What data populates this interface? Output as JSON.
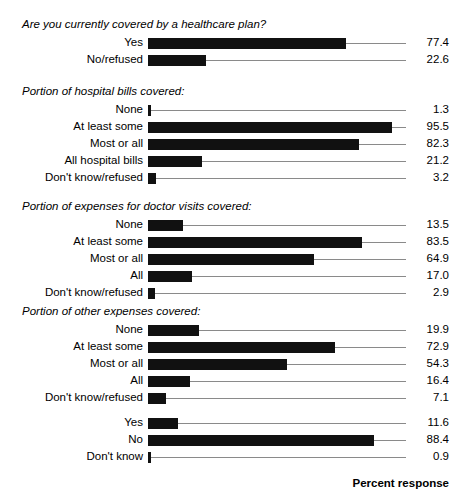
{
  "chart_data": {
    "type": "bar",
    "orientation": "horizontal",
    "title": "",
    "xlabel": "Percent response",
    "ylabel": "",
    "xlim": [
      0,
      100
    ],
    "grid": false,
    "legend": null,
    "value_labels": true,
    "bar_color": "#111111",
    "leader_color": "#8a8a8a",
    "groups": [
      {
        "title": "Are you currently covered by a healthcare plan?",
        "categories": [
          "Yes",
          "No/refused"
        ],
        "values": [
          77.4,
          22.6
        ],
        "value_labels": [
          "77.4",
          "22.6"
        ]
      },
      {
        "title": "Portion of hospital bills covered:",
        "categories": [
          "None",
          "At least some",
          "Most or all",
          "All hospital bills",
          "Don't know/refused"
        ],
        "values": [
          1.3,
          95.5,
          82.3,
          21.2,
          3.2
        ],
        "value_labels": [
          "1.3",
          "95.5",
          "82.3",
          "21.2",
          "3.2"
        ]
      },
      {
        "title": "Portion of expenses for doctor visits covered:",
        "categories": [
          "None",
          "At least some",
          "Most or all",
          "All",
          "Don't know/refused"
        ],
        "values": [
          13.5,
          83.5,
          64.9,
          17.0,
          2.9
        ],
        "value_labels": [
          "13.5",
          "83.5",
          "64.9",
          "17.0",
          "2.9"
        ]
      },
      {
        "title": "Portion of other expenses covered:",
        "categories": [
          "None",
          "At least some",
          "Most or all",
          "All",
          "Don't know/refused"
        ],
        "values": [
          19.9,
          72.9,
          54.3,
          16.4,
          7.1
        ],
        "value_labels": [
          "19.9",
          "72.9",
          "54.3",
          "16.4",
          "7.1"
        ]
      },
      {
        "title": "",
        "categories": [
          "Yes",
          "No",
          "Don't know"
        ],
        "values": [
          11.6,
          88.4,
          0.9
        ],
        "value_labels": [
          "11.6",
          "88.4",
          "0.9"
        ]
      }
    ]
  },
  "axis": {
    "x_title": "Percent response"
  },
  "artifact": {
    "top_fragment": "scanned page header fragment"
  }
}
